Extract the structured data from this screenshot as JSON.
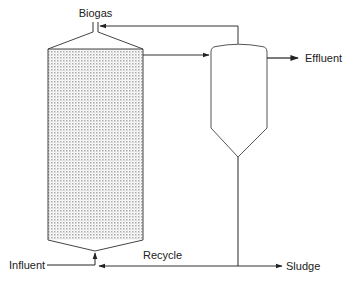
{
  "diagram": {
    "title": "",
    "labels": {
      "biogas": "Biogas",
      "effluent": "Effluent",
      "influent": "Influent",
      "recycle": "Recycle",
      "sludge": "Sludge"
    },
    "components": [
      {
        "id": "reactor",
        "label": "",
        "shape": "packed vessel with conical top and bottom"
      },
      {
        "id": "clarifier",
        "label": "",
        "shape": "settling tank with dome top and conical bottom"
      }
    ],
    "flows": [
      {
        "from": "influent",
        "to": "reactor-bottom",
        "label": "Influent"
      },
      {
        "from": "reactor-top-outlet",
        "to": "clarifier",
        "label": ""
      },
      {
        "from": "clarifier-top",
        "to": "reactor-gas-nozzle",
        "label": ""
      },
      {
        "from": "reactor-gas-nozzle",
        "to": "biogas",
        "label": "Biogas"
      },
      {
        "from": "clarifier",
        "to": "effluent",
        "label": "Effluent"
      },
      {
        "from": "clarifier-bottom",
        "to": "sludge",
        "label": "Sludge"
      },
      {
        "from": "clarifier-bottom",
        "to": "reactor-bottom",
        "label": "Recycle"
      }
    ],
    "colors": {
      "line": "#333333",
      "fill_pattern": "#9a9a9a",
      "background": "#ffffff"
    }
  }
}
